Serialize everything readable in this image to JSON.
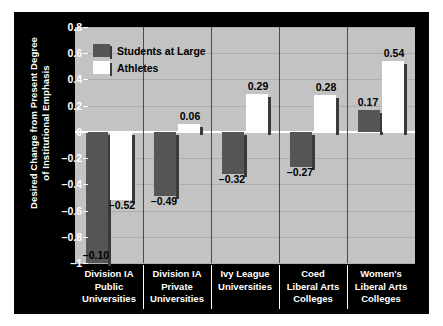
{
  "chart_data": {
    "type": "bar",
    "title": "",
    "xlabel": "",
    "ylabel": "Desired Change from Present Degree of Institutional Emphasis",
    "ylabel_lines": [
      "Desired Change from Present Degree",
      "of Institutional Emphasis"
    ],
    "ylim": [
      -1,
      0.8
    ],
    "yticks": [
      0.8,
      0.6,
      0.4,
      0.2,
      0,
      -0.2,
      -0.4,
      -0.6,
      -0.8,
      -1
    ],
    "ytick_labels": [
      "0.8",
      "0.6",
      "0.4",
      "0.2",
      "0",
      "–0.2",
      "–0.4",
      "–0.6",
      "–0.8",
      "–1"
    ],
    "grid": true,
    "legend_position": "top-left",
    "categories": [
      "Division IA Public Universities",
      "Division IA Private Universities",
      "Ivy League Universities",
      "Coed Liberal Arts Colleges",
      "Women's Liberal Arts Colleges"
    ],
    "category_lines": [
      [
        "Division IA",
        "Public",
        "Universities"
      ],
      [
        "Division IA",
        "Private",
        "Universities"
      ],
      [
        "Ivy League",
        "Universities"
      ],
      [
        "Coed",
        "Liberal Arts",
        "Colleges"
      ],
      [
        "Women's",
        "Liberal Arts",
        "Colleges"
      ]
    ],
    "series": [
      {
        "name": "Students at Large",
        "color": "#555555",
        "values": [
          -1.1,
          -0.49,
          -0.32,
          -0.27,
          0.17
        ],
        "labels": [
          "–0.10",
          "–0.49",
          "–0.32",
          "–0.27",
          "0.17"
        ]
      },
      {
        "name": "Athletes",
        "color": "#ffffff",
        "values": [
          -0.52,
          0.06,
          0.29,
          0.28,
          0.54
        ],
        "labels": [
          "–0.52",
          "0.06",
          "0.29",
          "0.28",
          "0.54"
        ]
      }
    ]
  },
  "legend": {
    "items": [
      {
        "label": "Students at Large",
        "swatch": "dark"
      },
      {
        "label": "Athletes",
        "swatch": "light"
      }
    ]
  },
  "colors": {
    "background": "#000000",
    "plot_background": "#c3c3c3",
    "gridline": "#aeaeae",
    "zeroline": "#ffffff",
    "series_students": "#555555",
    "series_athletes": "#ffffff",
    "text_on_dark": "#ffffff",
    "text_on_plot": "#000000"
  }
}
